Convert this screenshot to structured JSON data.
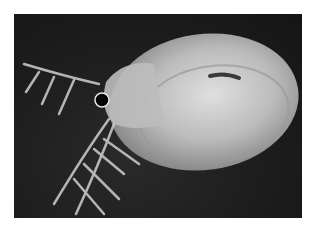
{
  "image": {
    "subject": "water flea (Daphnia) micrograph",
    "description": "Grayscale photograph of a translucent water flea with a large oval carapace, black compound eye, and branched antennae against a dark background",
    "colors": {
      "page_background": "#ffffff",
      "photo_background": "#1c1c1c",
      "body": "#d8d8d8",
      "eye": "#050505"
    }
  }
}
